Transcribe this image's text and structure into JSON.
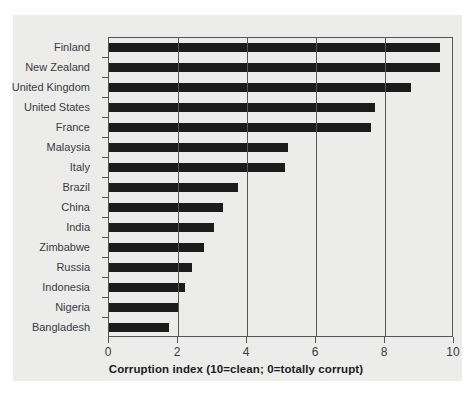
{
  "chart_data": {
    "type": "bar",
    "orientation": "horizontal",
    "title": "",
    "subtitle": "",
    "xlabel": "Corruption index (10=clean; 0=totally corrupt)",
    "ylabel": "",
    "xlim": [
      0,
      10
    ],
    "xticks": [
      "0",
      "2",
      "4",
      "6",
      "8",
      "10"
    ],
    "xtick_values": [
      0,
      2,
      4,
      6,
      8,
      10
    ],
    "grid": "vertical",
    "legend": "none",
    "bar_color": "#1b1b1b",
    "panel_color": "#ececeb",
    "axis_color": "#55565a",
    "categories": [
      "Finland",
      "New Zealand",
      "United Kingdom",
      "United States",
      "France",
      "Malaysia",
      "Italy",
      "Brazil",
      "China",
      "India",
      "Zimbabwe",
      "Russia",
      "Indonesia",
      "Nigeria",
      "Bangladesh"
    ],
    "values": [
      9.6,
      9.6,
      8.75,
      7.7,
      7.6,
      5.2,
      5.1,
      3.75,
      3.3,
      3.05,
      2.75,
      2.4,
      2.2,
      2.0,
      1.75
    ]
  }
}
